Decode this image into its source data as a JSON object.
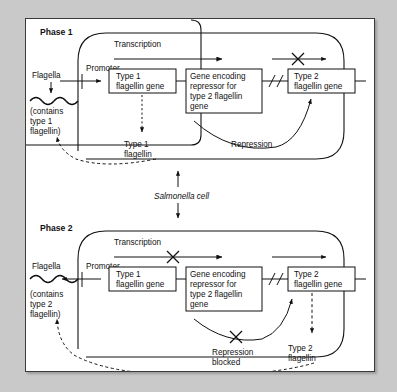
{
  "figure": {
    "organism_label": "Salmonella cell",
    "background_color": "#c9c9c9",
    "panel_color": "#ffffff",
    "ink_color": "#111111"
  },
  "phases": [
    {
      "id": "phase-1",
      "label": "Phase 1",
      "transcription_label": "Transcription",
      "promoter_label": "Promoter",
      "flagella_label": "Flagella",
      "flagella_contents": "(contains\ntype 1\nflagellin)",
      "flagella_contents_lines": [
        "(contains",
        "type 1",
        "flagellin)"
      ],
      "genes": [
        {
          "name": "type-1-flagellin-gene",
          "lines": [
            "Type 1",
            "flagellin gene"
          ]
        },
        {
          "name": "repressor-gene",
          "lines": [
            "Gene encoding",
            "repressor for",
            "type 2 flagellin",
            "gene"
          ]
        },
        {
          "name": "type-2-flagellin-gene",
          "lines": [
            "Type 2",
            "flagellin gene"
          ]
        }
      ],
      "product_label_lines": [
        "Type 1",
        "flagellin"
      ],
      "regulation_label": "Repression",
      "regulation_blocked": false,
      "promoter_orientation": "forward",
      "transcription_blocked_segment": "type-2",
      "product_expressed": "type 1 flagellin"
    },
    {
      "id": "phase-2",
      "label": "Phase 2",
      "transcription_label": "Transcription",
      "promoter_label": "Promoter",
      "flagella_label": "Flagella",
      "flagella_contents": "(contains\ntype 2\nflagellin)",
      "flagella_contents_lines": [
        "(contains",
        "type 2",
        "flagellin)"
      ],
      "genes": [
        {
          "name": "type-1-flagellin-gene",
          "lines": [
            "Type 1",
            "flagellin gene"
          ]
        },
        {
          "name": "repressor-gene",
          "lines": [
            "Gene encoding",
            "repressor for",
            "type 2 flagellin",
            "gene"
          ]
        },
        {
          "name": "type-2-flagellin-gene",
          "lines": [
            "Type 2",
            "flagellin gene"
          ]
        }
      ],
      "product_label_lines": [
        "Type 2",
        "flagellin"
      ],
      "regulation_label_lines": [
        "Repression",
        "blocked"
      ],
      "regulation_blocked": true,
      "promoter_orientation": "inverted",
      "transcription_blocked_segment": "type-1",
      "product_expressed": "type 2 flagellin"
    }
  ]
}
